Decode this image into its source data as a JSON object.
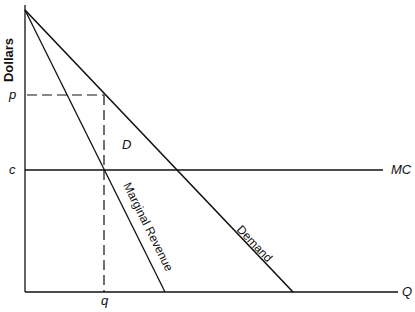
{
  "diagram": {
    "type": "monopoly pricing diagram",
    "y_axis_label": "Dollars",
    "x_axis_label": "Q",
    "price_label": "p",
    "cost_label": "c",
    "quantity_label": "q",
    "mc_label": "MC",
    "demand_curve_label": "Demand",
    "mr_curve_label": "Marginal Revenue",
    "region_label": "D"
  }
}
